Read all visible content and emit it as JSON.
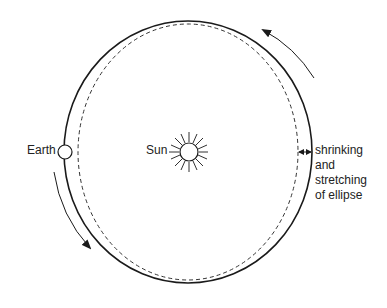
{
  "diagram": {
    "labels": {
      "earth": "Earth",
      "sun": "Sun",
      "note_lines": [
        "shrinking",
        "and",
        "stretching",
        "of ellipse"
      ]
    },
    "elements": {
      "outer_orbit": "solid ellipse (current orbit)",
      "inner_orbit": "dashed ellipse (alternate orbit shape)",
      "arrows": [
        "counter-clockwise arrow upper right",
        "counter-clockwise arrow lower left",
        "double-headed arrow between orbits at right"
      ]
    },
    "colors": {
      "stroke": "#1a1a1a",
      "background": "#ffffff"
    }
  }
}
